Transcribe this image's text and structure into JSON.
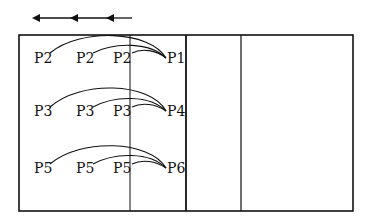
{
  "direction_arrows": {
    "icon": "left-arrow-icon",
    "count": 3
  },
  "rows": [
    {
      "sources": [
        "P2",
        "P2",
        "P2"
      ],
      "target": "P1"
    },
    {
      "sources": [
        "P3",
        "P3",
        "P3"
      ],
      "target": "P4"
    },
    {
      "sources": [
        "P5",
        "P5",
        "P5"
      ],
      "target": "P6"
    }
  ],
  "colors": {
    "stroke": "#111111",
    "background": "#ffffff"
  }
}
